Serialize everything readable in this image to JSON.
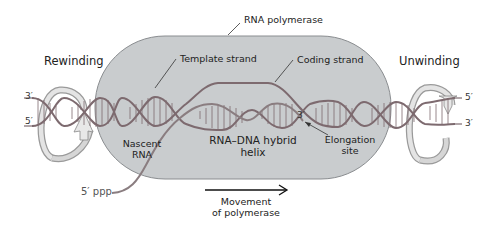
{
  "figure": {
    "colors": {
      "polymerase_fill": "#c9ccce",
      "polymerase_stroke": "#8a8d90",
      "dna_strand": "#7d6a6f",
      "rna_strand": "#8a7d80",
      "arrow_ribbon": "#b8b8b8",
      "text": "#222222"
    }
  },
  "labels": {
    "rna_polymerase": "RNA polymerase",
    "rewinding": "Rewinding",
    "unwinding": "Unwinding",
    "template_strand": "Template strand",
    "coding_strand": "Coding strand",
    "nascent_rna_line1": "Nascent",
    "nascent_rna_line2": "RNA",
    "hybrid_line1": "RNA–DNA hybrid",
    "hybrid_line2": "helix",
    "elongation_line1": "Elongation",
    "elongation_line2": "site",
    "five_ppp": "5′ ppp",
    "movement_line1": "Movement",
    "movement_line2": "of polymerase",
    "left_top_end": "3′",
    "left_bottom_end": "5′",
    "right_top_end": "5′",
    "right_bottom_end": "3′",
    "rna_3prime": "3′"
  }
}
